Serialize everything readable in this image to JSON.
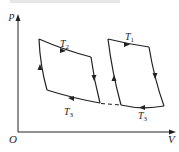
{
  "diagram": {
    "type": "p-V diagram",
    "axes": {
      "y_label": "p",
      "x_label": "V",
      "origin_label": "O"
    },
    "cycles": [
      {
        "name": "left-cycle",
        "upper_isotherm": {
          "T": "T",
          "sub": "2"
        },
        "lower_isotherm": {
          "T": "T",
          "sub": "3"
        }
      },
      {
        "name": "right-cycle",
        "upper_isotherm": {
          "T": "T",
          "sub": "1"
        },
        "lower_isotherm": {
          "T": "T",
          "sub": "3"
        }
      }
    ],
    "note": "Dashed line connects the two T3 isotherms"
  }
}
